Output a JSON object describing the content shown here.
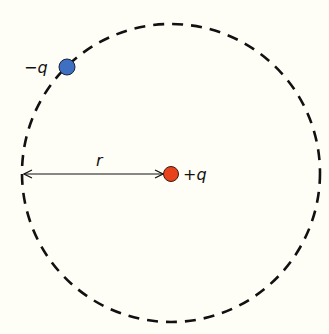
{
  "diagram": {
    "orbit_style": "dashed",
    "charges": [
      {
        "id": "negative",
        "label": "−q",
        "color": "#3f6fc0"
      },
      {
        "id": "positive",
        "label": "+q",
        "color": "#e8421c"
      }
    ],
    "radius_label": "r"
  }
}
